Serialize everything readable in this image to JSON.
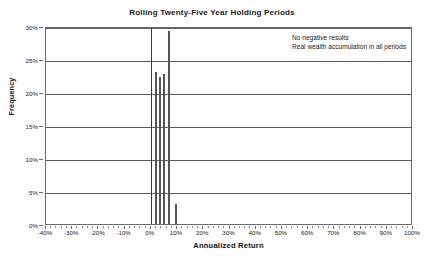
{
  "chart_data": {
    "type": "bar",
    "title": "Rolling Twenty-Five Year Holding Periods",
    "xlabel": "Annualized Return",
    "ylabel": "Frequency",
    "xlim": [
      -40,
      100
    ],
    "ylim": [
      0,
      30
    ],
    "x_tick_labels": [
      "-40%",
      "-30%",
      "-20%",
      "-10%",
      "0%",
      "10%",
      "20%",
      "30%",
      "40%",
      "50%",
      "60%",
      "70%",
      "80%",
      "90%",
      "100%"
    ],
    "x_tick_values": [
      -40,
      -30,
      -20,
      -10,
      0,
      10,
      20,
      30,
      40,
      50,
      60,
      70,
      80,
      90,
      100
    ],
    "x_minor_tick_step": 2,
    "y_tick_labels": [
      "0%",
      "5%",
      "10%",
      "15%",
      "20%",
      "25%",
      "30%"
    ],
    "y_tick_values": [
      0,
      5,
      10,
      15,
      20,
      25,
      30
    ],
    "grid": "horizontal",
    "legend": "none",
    "zero_reference_line": 0,
    "bar_color": "#555555",
    "grid_color": "#5d5d5d",
    "frame_color": "#6b6b6b",
    "x": [
      2.0,
      3.6,
      5.2,
      6.8,
      9.6
    ],
    "values": [
      23.0,
      22.2,
      22.8,
      29.3,
      3.1
    ],
    "bars": [
      {
        "x": 2.0,
        "value": 23.0
      },
      {
        "x": 3.6,
        "value": 22.2
      },
      {
        "x": 5.2,
        "value": 22.8
      },
      {
        "x": 6.8,
        "value": 29.3
      },
      {
        "x": 9.6,
        "value": 3.1
      }
    ],
    "annotations": [
      "No negative results",
      "Real wealth accumulation in all periods"
    ]
  }
}
